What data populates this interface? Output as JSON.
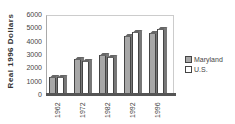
{
  "chart_data": {
    "type": "bar",
    "title": "",
    "xlabel": "",
    "ylabel": "Real 1996 Dollars",
    "ylim": [
      0,
      6000
    ],
    "yticks": [
      "0",
      "1000",
      "2000",
      "3000",
      "4000",
      "5000",
      "6000"
    ],
    "categories": [
      "1962",
      "1972",
      "1982",
      "1992",
      "1996"
    ],
    "series": [
      {
        "name": "Maryland",
        "color": "#a8a8a8",
        "values": [
          1450,
          2800,
          3100,
          4500,
          4750
        ]
      },
      {
        "name": "U.S.",
        "color": "#ffffff",
        "values": [
          1450,
          2600,
          2950,
          4800,
          5000
        ]
      }
    ],
    "legend_position": "right",
    "grid": true,
    "style": "3d"
  }
}
